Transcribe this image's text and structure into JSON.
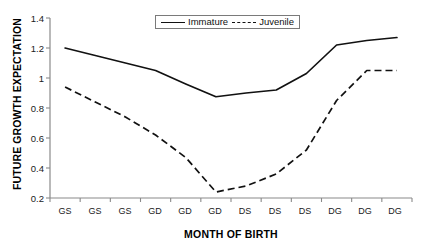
{
  "chart_data": {
    "type": "line",
    "title": "",
    "xlabel": "MONTH OF BIRTH",
    "ylabel": "FUTURE GROWTH EXPECTATION",
    "categories": [
      "GS",
      "GS",
      "GS",
      "GD",
      "GD",
      "GD",
      "DS",
      "DS",
      "DS",
      "DG",
      "DG",
      "DG"
    ],
    "ylim": [
      0.2,
      1.4
    ],
    "yticks": [
      "0.2",
      "0.4",
      "0.6",
      "0.8",
      "1",
      "1.2",
      "1.4"
    ],
    "ytick_values": [
      0.2,
      0.4,
      0.6,
      0.8,
      1.0,
      1.2,
      1.4
    ],
    "grid": false,
    "legend_position": "top-center",
    "series": [
      {
        "name": "Immature",
        "style": "solid",
        "color": "#111111",
        "values": [
          1.2,
          1.15,
          1.1,
          1.05,
          0.96,
          0.875,
          0.9,
          0.92,
          1.03,
          1.22,
          1.25,
          1.27
        ]
      },
      {
        "name": "Juvenile",
        "style": "dashed",
        "color": "#111111",
        "values": [
          0.94,
          0.84,
          0.74,
          0.62,
          0.47,
          0.24,
          0.28,
          0.36,
          0.52,
          0.85,
          1.05,
          1.05
        ]
      }
    ]
  },
  "axes": {
    "y_axis_name": "future-growth-expectation-axis",
    "x_axis_name": "month-of-birth-axis"
  }
}
